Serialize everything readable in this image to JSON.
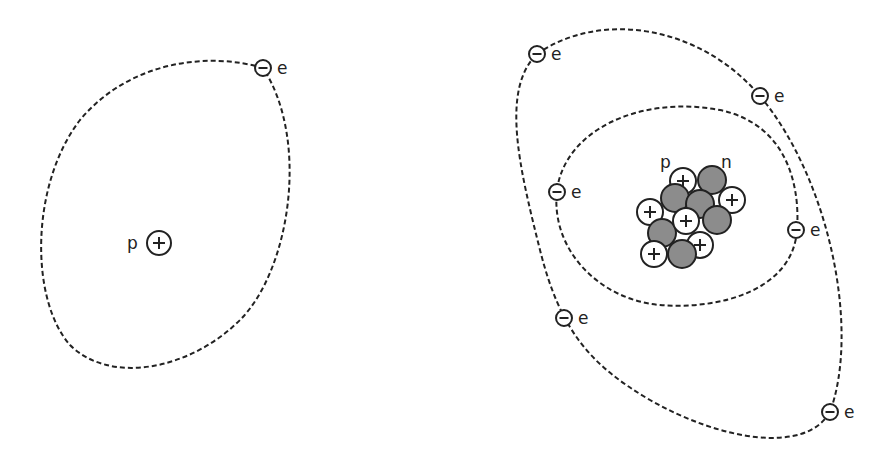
{
  "diagram": {
    "colors": {
      "line": "#222222",
      "neutron": "#8c8c8c",
      "proton": "#ffffff",
      "background": "#ffffff"
    },
    "hydrogen": {
      "proton_label": "p",
      "proton_sign": "+",
      "electron": {
        "sign": "−",
        "label": "e"
      }
    },
    "atom": {
      "nucleus_labels": {
        "proton": "p",
        "neutron": "n"
      },
      "proton_sign": "+",
      "inner_shell_electrons": [
        {
          "sign": "−",
          "label": "e"
        },
        {
          "sign": "−",
          "label": "e"
        }
      ],
      "outer_shell_electrons": [
        {
          "sign": "−",
          "label": "e"
        },
        {
          "sign": "−",
          "label": "e"
        },
        {
          "sign": "−",
          "label": "e"
        },
        {
          "sign": "−",
          "label": "e"
        }
      ]
    }
  }
}
